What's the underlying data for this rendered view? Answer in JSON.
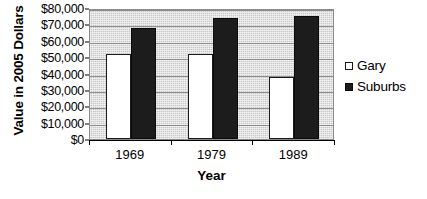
{
  "chart_data": {
    "type": "bar",
    "title": "",
    "subtitle": "",
    "xlabel": "Year",
    "ylabel": "Value in 2005 Dollars",
    "categories": [
      "1969",
      "1979",
      "1989"
    ],
    "series": [
      {
        "name": "Gary",
        "values": [
          52000,
          52000,
          38000
        ],
        "color": "#ffffff",
        "marker": "open-square"
      },
      {
        "name": "Suburbs",
        "values": [
          68000,
          74000,
          75000
        ],
        "color": "#1c1c1c",
        "marker": "filled-square"
      }
    ],
    "ylim": [
      0,
      80000
    ],
    "ytick_values": [
      0,
      10000,
      20000,
      30000,
      40000,
      50000,
      60000,
      70000,
      80000
    ],
    "ytick_labels": [
      "$0",
      "$10,000",
      "$20,000",
      "$30,000",
      "$40,000",
      "$50,000",
      "$60,000",
      "$70,000",
      "$80,000"
    ],
    "grid": true,
    "grid_axis": "y",
    "legend_position": "right",
    "plot_background": "#c9c9c9",
    "gridline_color": "#8e8e8e"
  },
  "axes": {
    "y_title": "Value in 2005 Dollars",
    "x_title": "Year"
  },
  "legend": {
    "entries": [
      {
        "label": "Gary"
      },
      {
        "label": "Suburbs"
      }
    ]
  }
}
